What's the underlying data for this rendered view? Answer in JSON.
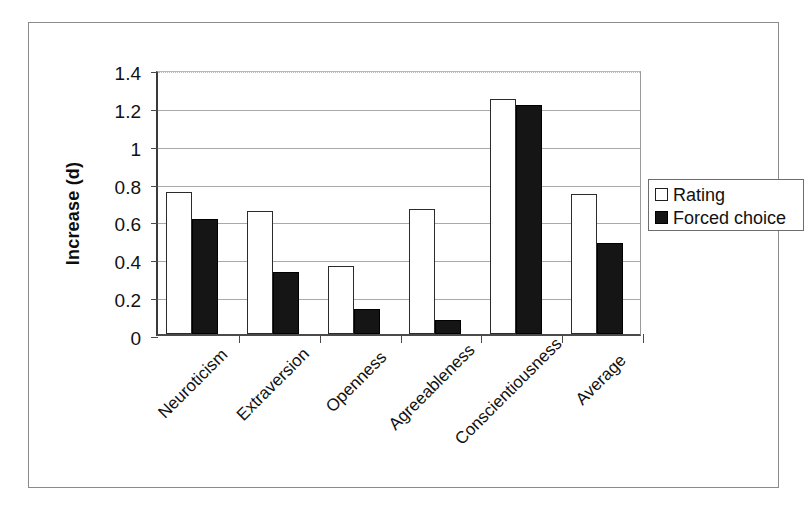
{
  "figure": {
    "y_axis_title": "Increase (d)"
  },
  "legend": {
    "position": "right",
    "entries": [
      {
        "label": "Rating",
        "swatch": "open-square-icon",
        "color": "#ffffff"
      },
      {
        "label": "Forced choice",
        "swatch": "filled-square-icon",
        "color": "#151515"
      }
    ]
  },
  "axis": {
    "y_ticks": [
      "0",
      "0.2",
      "0.4",
      "0.6",
      "0.8",
      "1",
      "1.2",
      "1.4"
    ],
    "y_tick_values": [
      0,
      0.2,
      0.4,
      0.6,
      0.8,
      1,
      1.2,
      1.4
    ]
  },
  "chart_data": {
    "type": "bar",
    "title": "",
    "xlabel": "",
    "ylabel": "Increase (d)",
    "ylim": [
      0,
      1.4
    ],
    "ytick_step": 0.2,
    "grid": true,
    "legend_position": "right",
    "categories": [
      "Neuroticism",
      "Extraversion",
      "Openness",
      "Agreeableness",
      "Conscientiousness",
      "Average"
    ],
    "series": [
      {
        "name": "Rating",
        "color": "#ffffff",
        "edge_color": "#2b2b2b",
        "values": [
          0.75,
          0.65,
          0.36,
          0.66,
          1.24,
          0.74
        ]
      },
      {
        "name": "Forced choice",
        "color": "#151515",
        "edge_color": "#000000",
        "values": [
          0.61,
          0.33,
          0.13,
          0.075,
          1.21,
          0.48
        ]
      }
    ]
  }
}
